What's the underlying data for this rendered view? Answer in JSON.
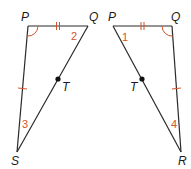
{
  "colors": {
    "line": "#2a2a2a",
    "mark": "#d2542a",
    "label": "#1a1a1a",
    "background": "#ffffff"
  },
  "left_triangle": {
    "vertices": {
      "P": "P",
      "Q": "Q",
      "T": "T",
      "S": "S"
    },
    "angle_labels": {
      "at_Q": "2",
      "at_S": "3"
    },
    "congruence_marks": {
      "PQ": "double-tick",
      "PS": "single-tick",
      "angle_P": "arc"
    }
  },
  "right_triangle": {
    "vertices": {
      "P": "P",
      "Q": "Q",
      "T": "T",
      "R": "R"
    },
    "angle_labels": {
      "at_P": "1",
      "at_R": "4"
    },
    "congruence_marks": {
      "PQ": "double-tick",
      "QR": "single-tick",
      "angle_Q": "arc"
    }
  }
}
